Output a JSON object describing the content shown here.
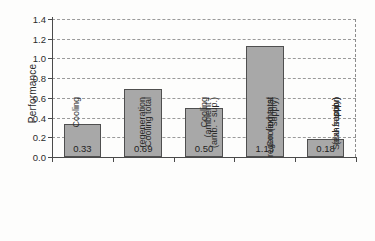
{
  "chart_data": {
    "type": "bar",
    "title": "",
    "xlabel": "",
    "ylabel": "Performance",
    "ylim": [
      0.0,
      1.4
    ],
    "ytick_labels": [
      "0.0",
      "0.2",
      "0.4",
      "0.6",
      "0.8",
      "1.0",
      "1.2",
      "1.4"
    ],
    "ytick_values": [
      0.0,
      0.2,
      0.4,
      0.6,
      0.8,
      1.0,
      1.2,
      1.4
    ],
    "grid": "horizontal-dashed",
    "legend": "none",
    "bar_color": "#a8a8a8",
    "bar_edge_color": "#4f4f4f",
    "categories": [
      "Cooling regeneration (ambient - supply)",
      "Cooling total (amb. - sup.)",
      "Cooling regen (exhaust - supply)",
      "Cooling total (exh. - sup.)",
      "Solar fraction"
    ],
    "category_lines": [
      [
        "Cooling",
        "regeneration",
        "(ambient -",
        "supply)"
      ],
      [
        "Cooling total",
        "(amb. - sup.)"
      ],
      [
        "Cooling",
        "regen (exhaust",
        "- supply)"
      ],
      [
        "Cooling total",
        "(exh. - sup.)"
      ],
      [
        "Solar fraction"
      ]
    ],
    "values": [
      0.33,
      0.69,
      0.5,
      1.13,
      0.18
    ],
    "value_labels": [
      "0.33",
      "0.69",
      "0.50",
      "1.13",
      "0.18"
    ]
  }
}
